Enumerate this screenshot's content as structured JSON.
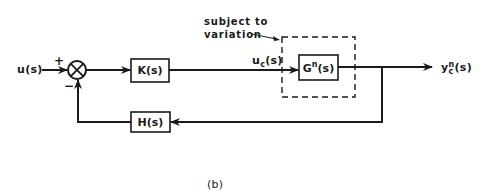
{
  "diagram": {
    "type": "feedback-control-block-diagram",
    "caption": "(b)",
    "input": {
      "label": "u(s)"
    },
    "summing_junction": {
      "plus_sign": "+",
      "minus_sign": "−"
    },
    "blocks": {
      "controller": {
        "label": "K(s)"
      },
      "plant": {
        "base": "G",
        "superscript": "n",
        "suffix": "(s)"
      },
      "feedback": {
        "label": "H(s)"
      }
    },
    "signals": {
      "control": {
        "base": "u",
        "subscript": "c",
        "suffix": "(s)"
      },
      "output": {
        "base": "y",
        "subscript": "c",
        "superscript": "n",
        "suffix": "(s)"
      }
    },
    "annotation": {
      "line1": "subject to",
      "line2": "variation"
    },
    "nodes": [
      "u(s)",
      "summing junction",
      "K(s)",
      "G^n(s)",
      "y_c^n(s)",
      "H(s)"
    ],
    "edges": [
      [
        "u(s)",
        "summing junction",
        "+"
      ],
      [
        "summing junction",
        "K(s)"
      ],
      [
        "K(s)",
        "G^n(s)",
        "u_c(s)"
      ],
      [
        "G^n(s)",
        "y_c^n(s)"
      ],
      [
        "G^n(s)",
        "H(s)"
      ],
      [
        "H(s)",
        "summing junction",
        "−"
      ]
    ]
  }
}
